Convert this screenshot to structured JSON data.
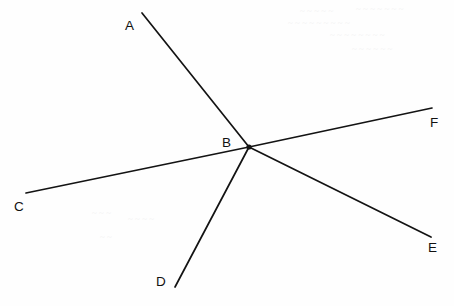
{
  "figure": {
    "type": "geometry-diagram",
    "width": 454,
    "height": 306,
    "background_color": "#fefefe",
    "line_color": "#131313",
    "label_color": "#111111",
    "vertex": {
      "label": "B",
      "x": 249,
      "y": 147,
      "label_x": 222,
      "label_y": 147,
      "dot_radius": 2.6
    },
    "rays": [
      {
        "name": "ray-ba",
        "label": "A",
        "from_x": 249,
        "from_y": 147,
        "to_x": 142,
        "to_y": 13,
        "label_x": 125,
        "label_y": 30
      },
      {
        "name": "ray-bc",
        "label": "C",
        "from_x": 249,
        "from_y": 147,
        "to_x": 26,
        "to_y": 193,
        "label_x": 14,
        "label_y": 211
      },
      {
        "name": "ray-bd",
        "label": "D",
        "from_x": 249,
        "from_y": 147,
        "to_x": 175,
        "to_y": 287,
        "label_x": 156,
        "label_y": 286
      },
      {
        "name": "ray-be",
        "label": "E",
        "from_x": 249,
        "from_y": 147,
        "to_x": 431,
        "to_y": 237,
        "label_x": 428,
        "label_y": 252
      },
      {
        "name": "ray-bf",
        "label": "F",
        "from_x": 249,
        "from_y": 147,
        "to_x": 432,
        "to_y": 108,
        "label_x": 430,
        "label_y": 127
      }
    ],
    "bleed_marks": [
      {
        "text": "~ ~ ~ ~ ~",
        "x": 300,
        "y": 6
      },
      {
        "text": "~ ~ ~ ~ ~ ~ ~",
        "x": 356,
        "y": 4
      },
      {
        "text": "~ ~ ~ ~ ~ ~ ~ ~ ~",
        "x": 288,
        "y": 18
      },
      {
        "text": "~ ~ ~ ~ ~ ~ ~ ~",
        "x": 330,
        "y": 30
      },
      {
        "text": "~ ~ ~ ~ ~ ~",
        "x": 352,
        "y": 44
      },
      {
        "text": "~ ~ ~",
        "x": 92,
        "y": 208
      },
      {
        "text": "~ ~ ~ ~",
        "x": 128,
        "y": 214
      },
      {
        "text": "~ ~",
        "x": 100,
        "y": 232
      }
    ]
  }
}
